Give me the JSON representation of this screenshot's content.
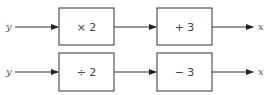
{
  "diagram": {
    "type": "function-machine",
    "rows": [
      {
        "input": "y",
        "boxes": [
          {
            "label": "× 2"
          },
          {
            "label": "+ 3"
          }
        ],
        "output": "x"
      },
      {
        "input": "y",
        "boxes": [
          {
            "label": "÷ 2"
          },
          {
            "label": "− 3"
          }
        ],
        "output": "x"
      }
    ]
  },
  "colors": {
    "stroke": "#333333",
    "text": "#444444"
  }
}
